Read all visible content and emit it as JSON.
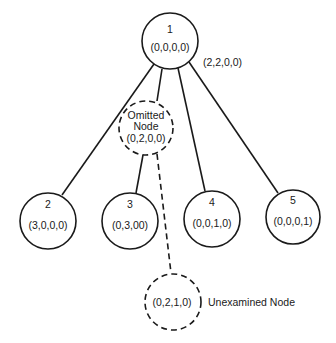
{
  "diagram": {
    "type": "search-tree",
    "nodes": [
      {
        "id": "1",
        "label": "1",
        "state": "(0,0,0,0)",
        "style": "solid"
      },
      {
        "id": "omitted",
        "label_line1": "Omitted",
        "label_line2": "Node",
        "state": "(0,2,0,0)",
        "style": "dashed"
      },
      {
        "id": "2",
        "label": "2",
        "state": "(3,0,0,0)",
        "style": "solid"
      },
      {
        "id": "3",
        "label": "3",
        "state": "(0,3,00)",
        "style": "solid"
      },
      {
        "id": "4",
        "label": "4",
        "state": "(0,0,1,0)",
        "style": "solid"
      },
      {
        "id": "5",
        "label": "5",
        "state": "(0,0,0,1)",
        "style": "solid"
      },
      {
        "id": "unexamined",
        "state": "(0,2,1,0)",
        "style": "dashed"
      }
    ],
    "edges": [
      {
        "from": "1",
        "to": "2",
        "style": "solid"
      },
      {
        "from": "1",
        "to": "omitted",
        "style": "solid"
      },
      {
        "from": "1",
        "to": "4",
        "style": "solid"
      },
      {
        "from": "1",
        "to": "5",
        "style": "solid"
      },
      {
        "from": "omitted",
        "to": "3",
        "style": "solid"
      },
      {
        "from": "omitted",
        "to": "unexamined",
        "style": "dashed"
      }
    ],
    "annotations": {
      "root_side_label": "(2,2,0,0)",
      "unexamined_label": "Unexamined Node"
    }
  }
}
